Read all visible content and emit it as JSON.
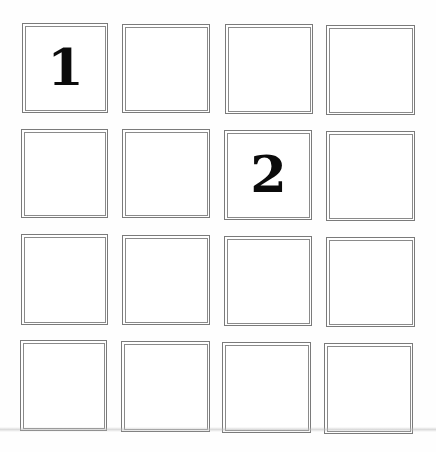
{
  "grid": {
    "rows": 4,
    "columns": 4,
    "cells": [
      {
        "row": 1,
        "col": 1,
        "label": "1"
      },
      {
        "row": 1,
        "col": 2,
        "label": ""
      },
      {
        "row": 1,
        "col": 3,
        "label": ""
      },
      {
        "row": 1,
        "col": 4,
        "label": ""
      },
      {
        "row": 2,
        "col": 1,
        "label": ""
      },
      {
        "row": 2,
        "col": 2,
        "label": ""
      },
      {
        "row": 2,
        "col": 3,
        "label": "2"
      },
      {
        "row": 2,
        "col": 4,
        "label": ""
      },
      {
        "row": 3,
        "col": 1,
        "label": ""
      },
      {
        "row": 3,
        "col": 2,
        "label": ""
      },
      {
        "row": 3,
        "col": 3,
        "label": ""
      },
      {
        "row": 3,
        "col": 4,
        "label": ""
      },
      {
        "row": 4,
        "col": 1,
        "label": ""
      },
      {
        "row": 4,
        "col": 2,
        "label": ""
      },
      {
        "row": 4,
        "col": 3,
        "label": ""
      },
      {
        "row": 4,
        "col": 4,
        "label": ""
      }
    ]
  },
  "colors": {
    "border_outer": "#7a7a7a",
    "border_inner": "#8a8a8a",
    "numeral": "#0b0b0b",
    "background": "#ffffff"
  }
}
